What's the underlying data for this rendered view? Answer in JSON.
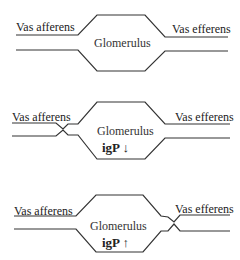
{
  "diagrams": [
    {
      "id": "normal",
      "afferent_label": "Vas afferens",
      "efferent_label": "Vas efferens",
      "center_label": "Glomerulus",
      "pressure_label": null
    },
    {
      "id": "afferent-constriction",
      "afferent_label": "Vas afferens",
      "efferent_label": "Vas efferens",
      "center_label": "Glomerulus",
      "pressure_label": "igP ↓"
    },
    {
      "id": "efferent-constriction",
      "afferent_label": "Vas afferens",
      "efferent_label": "Vas efferens",
      "center_label": "Glomerulus",
      "pressure_label": "igP ↑"
    }
  ],
  "colors": {
    "line": "#333333",
    "text": "#222222"
  }
}
